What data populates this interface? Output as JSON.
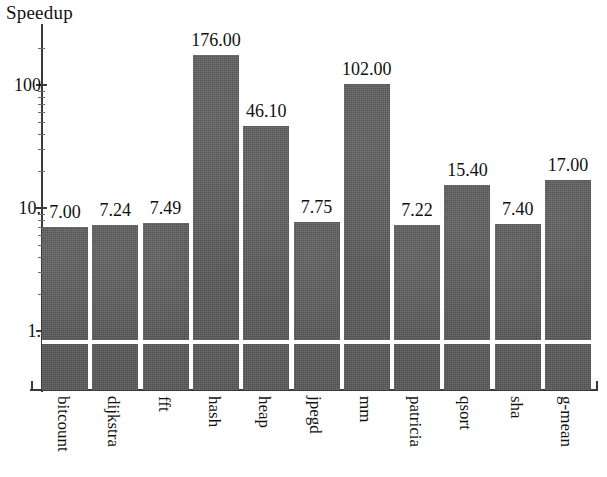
{
  "chart_data": {
    "type": "bar",
    "title": "",
    "ylabel": "Speedup",
    "xlabel": "",
    "yscale": "log",
    "ylim": [
      0.55,
      260
    ],
    "grid": false,
    "gridline_at": 1,
    "legend": "none",
    "ytick_labels": [
      "100",
      "10.",
      "1."
    ],
    "ytick_values": [
      100,
      10,
      1
    ],
    "categories": [
      "bitcount",
      "dijkstra",
      "fft",
      "hash",
      "heap",
      "jpegd",
      "mm",
      "patricia",
      "qsort",
      "sha",
      "g-mean"
    ],
    "values": [
      7.0,
      7.24,
      7.49,
      176.0,
      46.1,
      7.75,
      102.0,
      7.22,
      15.4,
      7.4,
      17.0
    ],
    "value_labels": [
      "7.00",
      "7.24",
      "7.49",
      "176.00",
      "46.10",
      "7.75",
      "102.00",
      "7.22",
      "15.40",
      "7.40",
      "17.00"
    ],
    "bar_color": "#5b5b5b",
    "background_color": "#ffffff",
    "axis_color": "#3a3a3a"
  },
  "axis": {
    "y_title": "Speedup"
  }
}
